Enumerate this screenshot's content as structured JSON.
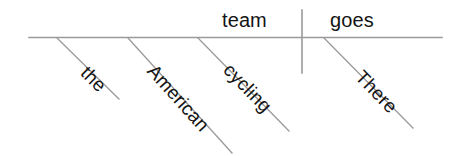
{
  "diagram": {
    "type": "sentence-diagram",
    "style": "reed-kellogg",
    "sentence": "There goes the American cycling team",
    "canvas": {
      "width": 460,
      "height": 156,
      "background": "#ffffff"
    },
    "colors": {
      "line": "#9a9a9a",
      "text": "#141414",
      "background": "#ffffff"
    },
    "baseline": {
      "name": "main-horizontal-line",
      "x1": 29,
      "y1": 37.5,
      "x2": 442,
      "y2": 37.5
    },
    "divider": {
      "name": "subject-predicate-divider",
      "x1": 302,
      "y1": 10,
      "x2": 302,
      "y2": 73
    },
    "horizontal_words": [
      {
        "id": "team",
        "text": "team",
        "x": 222,
        "y": 10,
        "role": "subject"
      },
      {
        "id": "goes",
        "text": "goes",
        "x": 330,
        "y": 10,
        "role": "verb"
      }
    ],
    "diagonal_words": [
      {
        "id": "the",
        "text": "the",
        "role": "article",
        "line": {
          "x1": 57,
          "y1": 38,
          "x2": 119,
          "y2": 99
        },
        "label": {
          "x": 84,
          "y": 60,
          "rotate": 45
        }
      },
      {
        "id": "american",
        "text": "American",
        "role": "adjective",
        "line": {
          "x1": 128,
          "y1": 38,
          "x2": 232,
          "y2": 153
        },
        "label": {
          "x": 151,
          "y": 58,
          "rotate": 48
        }
      },
      {
        "id": "cycling",
        "text": "cycling",
        "role": "adjective",
        "line": {
          "x1": 198,
          "y1": 38,
          "x2": 289,
          "y2": 131
        },
        "label": {
          "x": 227,
          "y": 57,
          "rotate": 46
        }
      },
      {
        "id": "there",
        "text": "There",
        "role": "adverb",
        "line": {
          "x1": 324,
          "y1": 38,
          "x2": 413,
          "y2": 128
        },
        "label": {
          "x": 359,
          "y": 64,
          "rotate": 46
        }
      }
    ]
  }
}
